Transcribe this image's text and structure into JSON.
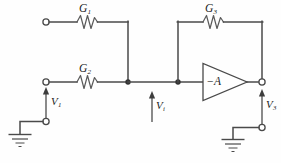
{
  "figure": {
    "kind": "circuit-schematic",
    "background_color": "#fefefe",
    "wire_color": "#4a4a4a",
    "label_color": "#1c1c1c",
    "node_color": "#333333"
  },
  "components": {
    "resistor_g1": {
      "label": "G",
      "subscript": "1",
      "type": "resistor-zigzag",
      "orientation": "horizontal"
    },
    "resistor_g2": {
      "label": "G",
      "subscript": "2",
      "type": "resistor-zigzag",
      "orientation": "horizontal"
    },
    "resistor_g3": {
      "label": "G",
      "subscript": "3",
      "type": "resistor-zigzag",
      "orientation": "horizontal"
    },
    "amplifier": {
      "label_sign": "−",
      "label_gain": "A",
      "type": "triangle-amplifier",
      "direction": "right"
    }
  },
  "nodes": {
    "input_terminal_top": {
      "type": "open-terminal"
    },
    "input_terminal_v1": {
      "type": "open-terminal"
    },
    "ground_terminal_left": {
      "type": "open-terminal"
    },
    "ground_terminal_right": {
      "type": "open-terminal"
    },
    "output_terminal_v3": {
      "type": "open-terminal"
    },
    "summing_junction": {
      "type": "junction-dot"
    },
    "feedback_junction": {
      "type": "junction-dot"
    }
  },
  "voltages": {
    "v1": {
      "label": "V",
      "subscript": "1",
      "direction": "up"
    },
    "vi": {
      "label": "V",
      "subscript": "i",
      "direction": "up"
    },
    "v3": {
      "label": "V",
      "subscript": "3",
      "direction": "up"
    }
  },
  "grounds": {
    "left": {
      "symbol": "earth-ground",
      "bars": 4
    },
    "right": {
      "symbol": "earth-ground",
      "bars": 4
    }
  }
}
